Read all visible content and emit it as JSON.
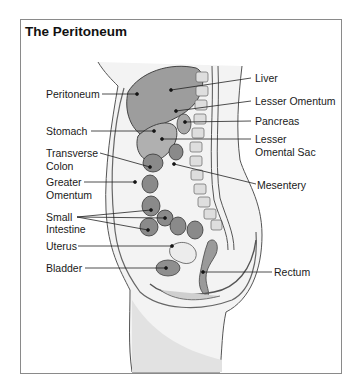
{
  "figure": {
    "title": "The Peritoneum"
  },
  "labels": {
    "left": {
      "peritoneum": "Peritoneum",
      "stomach": "Stomach",
      "transverse_colon_1": "Transverse",
      "transverse_colon_2": "Colon",
      "greater_omentum_1": "Greater",
      "greater_omentum_2": "Omentum",
      "small_intestine_1": "Small",
      "small_intestine_2": "Intestine",
      "uterus": "Uterus",
      "bladder": "Bladder"
    },
    "right": {
      "liver": "Liver",
      "lesser_omentum": "Lesser Omentum",
      "pancreas": "Pancreas",
      "lesser_omental_sac_1": "Lesser",
      "lesser_omental_sac_2": "Omental Sac",
      "mesentery": "Mesentery",
      "rectum": "Rectum"
    }
  },
  "colors": {
    "frame": "#8a8a8a",
    "line": "#222222",
    "organ_fill": "#8f8f8f",
    "organ_light": "#c9c9c9",
    "body_shade": "#e6e6e6"
  }
}
